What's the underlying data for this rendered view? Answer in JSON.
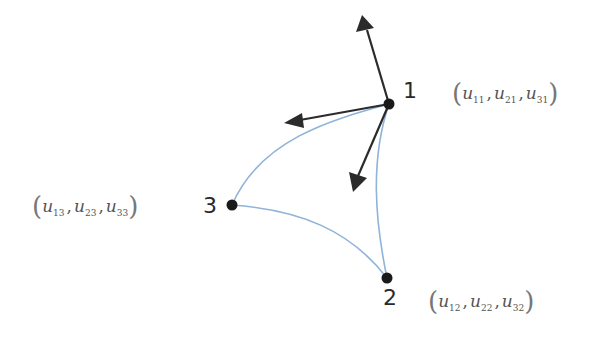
{
  "diagram": {
    "colors": {
      "background": "#ffffff",
      "arrow": "#2b2b2b",
      "edge": "#8fb3d9",
      "node": "#1a1a1a",
      "text": "#2a2a2a"
    },
    "nodes": [
      {
        "id": "1",
        "label": "1",
        "x": 389,
        "y": 104,
        "triple": {
          "a": "u",
          "a_sub": "11",
          "b": "u",
          "b_sub": "21",
          "c": "u",
          "c_sub": "31"
        }
      },
      {
        "id": "2",
        "label": "2",
        "x": 387,
        "y": 278,
        "triple": {
          "a": "u",
          "a_sub": "12",
          "b": "u",
          "b_sub": "22",
          "c": "u",
          "c_sub": "32"
        }
      },
      {
        "id": "3",
        "label": "3",
        "x": 232,
        "y": 205,
        "triple": {
          "a": "u",
          "a_sub": "13",
          "b": "u",
          "b_sub": "23",
          "c": "u",
          "c_sub": "33"
        }
      }
    ],
    "edges": [
      {
        "from": "1",
        "to": "3",
        "type": "curve"
      },
      {
        "from": "3",
        "to": "2",
        "type": "curve"
      },
      {
        "from": "2",
        "to": "1",
        "type": "curve"
      }
    ],
    "arrows": [
      {
        "from": "1",
        "direction": "up",
        "tip_x": 365,
        "tip_y": 18
      },
      {
        "from": "1",
        "direction": "left",
        "tip_x": 286,
        "tip_y": 122
      },
      {
        "from": "1",
        "direction": "down-left",
        "tip_x": 354,
        "tip_y": 188
      }
    ]
  }
}
